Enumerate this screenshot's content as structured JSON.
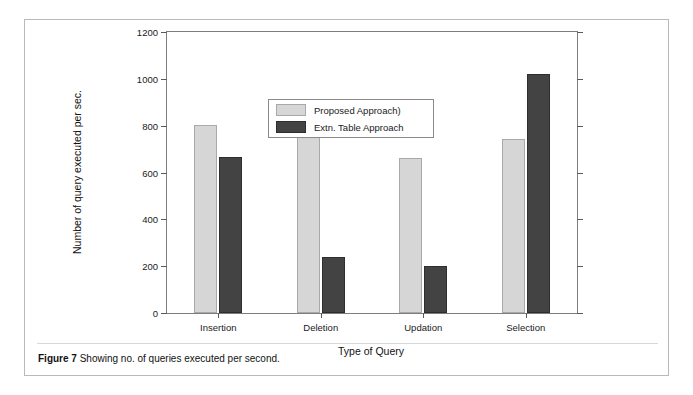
{
  "figure": {
    "caption_bold": "Figure 7",
    "caption_rest": "Showing no. of queries executed per second."
  },
  "chart_data": {
    "type": "bar",
    "title": "",
    "xlabel": "Type of Query",
    "ylabel": "Number of query executed per sec.",
    "categories": [
      "Insertion",
      "Deletion",
      "Updation",
      "Selection"
    ],
    "series": [
      {
        "name": "Proposed Approach)",
        "color": "#d6d6d6",
        "values": [
          805,
          805,
          662,
          745
        ]
      },
      {
        "name": "Extn. Table Approach",
        "color": "#434343",
        "values": [
          665,
          240,
          200,
          1020
        ]
      }
    ],
    "ylim": [
      0,
      1200
    ],
    "yticks": [
      0,
      200,
      400,
      600,
      800,
      1000,
      1200
    ],
    "ytick_labels": [
      "0",
      "200",
      "400",
      "600",
      "800",
      "1000",
      "1200"
    ],
    "grid": false,
    "legend_position": "upper center"
  }
}
